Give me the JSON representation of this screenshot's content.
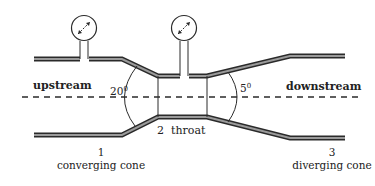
{
  "diagram": {
    "labels": {
      "upstream": "upstream",
      "downstream": "downstream",
      "converging_angle": "20",
      "diverging_angle": "5",
      "degree_symbol": "0",
      "throat_number": "2",
      "throat": "throat",
      "section1_number": "1",
      "section1_name": "converging cone",
      "section3_number": "3",
      "section3_name": "diverging cone"
    },
    "components": [
      {
        "name": "upstream-pressure-gauge"
      },
      {
        "name": "throat-pressure-gauge"
      },
      {
        "name": "converging-cone"
      },
      {
        "name": "throat"
      },
      {
        "name": "diverging-cone"
      },
      {
        "name": "centerline"
      }
    ],
    "colors": {
      "wall_outline": "#2a2a2a",
      "wall_fill": "#9a9a9a",
      "text": "#222222",
      "background": "#ffffff"
    }
  }
}
